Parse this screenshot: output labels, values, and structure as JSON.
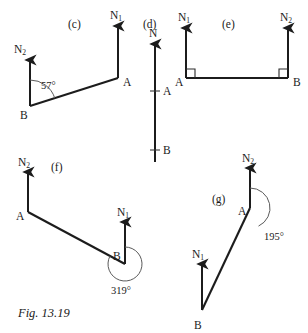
{
  "figure": {
    "caption": "Fig. 13.19",
    "caption_pos": {
      "x": 18,
      "y": 306
    },
    "background": "#ffffff",
    "ink_color": "#1c1c1c",
    "thin_ink_color": "#5a5a5a"
  },
  "panels": [
    {
      "id": "c",
      "tag": "(c)",
      "tag_pos": {
        "x": 68,
        "y": 18
      },
      "description": "Bearing diagram with north arrows at A and B, angle 57 degrees at B",
      "points": [
        {
          "name": "A",
          "x": 118,
          "y": 78,
          "label": "A",
          "label_pos": {
            "x": 123,
            "y": 77
          }
        },
        {
          "name": "B",
          "x": 30,
          "y": 106,
          "label": "B",
          "label_pos": {
            "x": 20,
            "y": 110
          }
        }
      ],
      "north_arrows": [
        {
          "name": "N1",
          "label": "N",
          "sub": "1",
          "from": {
            "x": 118,
            "y": 78
          },
          "to": {
            "x": 118,
            "y": 26
          },
          "label_pos": {
            "x": 110,
            "y": 10
          }
        },
        {
          "name": "N2",
          "label": "N",
          "sub": "2",
          "from": {
            "x": 30,
            "y": 106
          },
          "to": {
            "x": 30,
            "y": 60
          },
          "label_pos": {
            "x": 14,
            "y": 44
          }
        }
      ],
      "segments": [
        {
          "from": {
            "x": 30,
            "y": 106
          },
          "to": {
            "x": 118,
            "y": 78
          }
        }
      ],
      "angles": [
        {
          "value": "57°",
          "at": "B",
          "label_pos": {
            "x": 41,
            "y": 80
          },
          "arc": {
            "cx": 30,
            "cy": 106,
            "r": 26,
            "start_deg": -90,
            "end_deg": -17.6
          }
        }
      ]
    },
    {
      "id": "d",
      "tag": "(d)",
      "tag_pos": {
        "x": 143,
        "y": 18
      },
      "description": "Single vertical north line with tick marks at A and B",
      "points": [
        {
          "name": "A",
          "x": 155,
          "y": 91,
          "label": "A",
          "label_pos": {
            "x": 163,
            "y": 86
          }
        },
        {
          "name": "B",
          "x": 155,
          "y": 150,
          "label": "B",
          "label_pos": {
            "x": 163,
            "y": 145
          }
        }
      ],
      "north_arrows": [
        {
          "name": "N",
          "label": "N",
          "sub": "",
          "from": {
            "x": 155,
            "y": 162
          },
          "to": {
            "x": 155,
            "y": 44
          },
          "label_pos": {
            "x": 149,
            "y": 28
          }
        }
      ],
      "ticks": [
        {
          "x": 155,
          "y": 91,
          "half_width": 5
        },
        {
          "x": 155,
          "y": 150,
          "half_width": 5
        }
      ],
      "segments": [],
      "angles": []
    },
    {
      "id": "e",
      "tag": "(e)",
      "tag_pos": {
        "x": 222,
        "y": 18
      },
      "description": "Horizontal line A to B with perpendicular north arrows and right-angle marks",
      "points": [
        {
          "name": "A",
          "x": 186,
          "y": 78,
          "label": "A",
          "label_pos": {
            "x": 175,
            "y": 77
          }
        },
        {
          "name": "B",
          "x": 288,
          "y": 78,
          "label": "B",
          "label_pos": {
            "x": 293,
            "y": 77
          }
        }
      ],
      "north_arrows": [
        {
          "name": "N1",
          "label": "N",
          "sub": "1",
          "from": {
            "x": 186,
            "y": 78
          },
          "to": {
            "x": 186,
            "y": 28
          },
          "label_pos": {
            "x": 178,
            "y": 12
          }
        },
        {
          "name": "N2",
          "label": "N",
          "sub": "2",
          "from": {
            "x": 288,
            "y": 78
          },
          "to": {
            "x": 288,
            "y": 28
          },
          "label_pos": {
            "x": 280,
            "y": 12
          }
        }
      ],
      "segments": [
        {
          "from": {
            "x": 186,
            "y": 78
          },
          "to": {
            "x": 288,
            "y": 78
          }
        }
      ],
      "right_angles": [
        {
          "at": {
            "x": 186,
            "y": 78
          },
          "dx": 1,
          "dy": -1,
          "size": 9
        },
        {
          "at": {
            "x": 288,
            "y": 78
          },
          "dx": -1,
          "dy": -1,
          "size": 9
        }
      ],
      "angles": []
    },
    {
      "id": "f",
      "tag": "(f)",
      "tag_pos": {
        "x": 51,
        "y": 161
      },
      "description": "Line from A down-right to B with 319 degree reflex angle arc at B",
      "points": [
        {
          "name": "A",
          "x": 28,
          "y": 212,
          "label": "A",
          "label_pos": {
            "x": 16,
            "y": 211
          }
        },
        {
          "name": "B",
          "x": 125,
          "y": 264,
          "label": "B",
          "label_pos": {
            "x": 113,
            "y": 251
          }
        }
      ],
      "north_arrows": [
        {
          "name": "N2",
          "label": "N",
          "sub": "2",
          "from": {
            "x": 28,
            "y": 212
          },
          "to": {
            "x": 28,
            "y": 172
          },
          "label_pos": {
            "x": 18,
            "y": 157
          }
        },
        {
          "name": "N1",
          "label": "N",
          "sub": "1",
          "from": {
            "x": 125,
            "y": 264
          },
          "to": {
            "x": 125,
            "y": 222
          },
          "label_pos": {
            "x": 117,
            "y": 207
          }
        }
      ],
      "segments": [
        {
          "from": {
            "x": 28,
            "y": 212
          },
          "to": {
            "x": 125,
            "y": 264
          }
        }
      ],
      "angles": [
        {
          "value": "319°",
          "at": "B",
          "label_pos": {
            "x": 111,
            "y": 285
          },
          "arc": {
            "cx": 125,
            "cy": 264,
            "r": 17,
            "start_deg": -90,
            "end_deg": 208.2
          }
        }
      ]
    },
    {
      "id": "g",
      "tag": "(g)",
      "tag_pos": {
        "x": 212,
        "y": 193
      },
      "description": "Line from B up-right to A with 195 degree reflex angle arc at A",
      "points": [
        {
          "name": "A",
          "x": 250,
          "y": 208,
          "label": "A",
          "label_pos": {
            "x": 238,
            "y": 206
          }
        },
        {
          "name": "B",
          "x": 202,
          "y": 310,
          "label": "B",
          "label_pos": {
            "x": 194,
            "y": 320
          }
        }
      ],
      "north_arrows": [
        {
          "name": "N2",
          "label": "N",
          "sub": "2",
          "from": {
            "x": 250,
            "y": 208
          },
          "to": {
            "x": 250,
            "y": 168
          },
          "label_pos": {
            "x": 242,
            "y": 153
          }
        },
        {
          "name": "N1",
          "label": "N",
          "sub": "1",
          "from": {
            "x": 202,
            "y": 310
          },
          "to": {
            "x": 202,
            "y": 264
          },
          "label_pos": {
            "x": 192,
            "y": 249
          }
        }
      ],
      "segments": [
        {
          "from": {
            "x": 202,
            "y": 310
          },
          "to": {
            "x": 250,
            "y": 208
          }
        }
      ],
      "angles": [
        {
          "value": "195°",
          "at": "A",
          "label_pos": {
            "x": 264,
            "y": 231
          },
          "arc": {
            "cx": 250,
            "cy": 208,
            "r": 20,
            "start_deg": -90,
            "end_deg": 64.8
          }
        }
      ]
    }
  ]
}
